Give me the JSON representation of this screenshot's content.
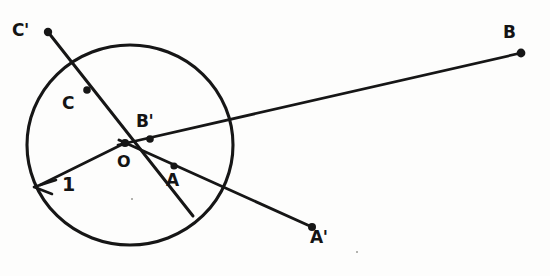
{
  "figure": {
    "background_color": "#fdfdfc",
    "ink_color": "#161616",
    "circle": {
      "name": "unit-circle",
      "center_x": 130,
      "center_y": 145,
      "radius_x": 103,
      "radius_y": 100
    },
    "radius_arrow": {
      "label": "1",
      "from_x": 125,
      "from_y": 143,
      "to_x": 35,
      "to_y": 187
    },
    "points": [
      {
        "id": "O",
        "label": "O",
        "x": 125,
        "y": 143,
        "label_x": 117,
        "label_y": 154,
        "dot": true
      },
      {
        "id": "A",
        "label": "A",
        "x": 174,
        "y": 166,
        "label_x": 166,
        "label_y": 172,
        "dot": true
      },
      {
        "id": "Ap",
        "label": "A'",
        "x": 312,
        "y": 227,
        "label_x": 311,
        "label_y": 229,
        "dot": true
      },
      {
        "id": "B",
        "label": "B",
        "x": 521,
        "y": 53,
        "label_x": 502,
        "label_y": 24,
        "dot": true
      },
      {
        "id": "Bp",
        "label": "B'",
        "x": 150,
        "y": 139,
        "label_x": 136,
        "label_y": 113,
        "dot": true
      },
      {
        "id": "C",
        "label": "C",
        "x": 87,
        "y": 90,
        "label_x": 62,
        "label_y": 95,
        "dot": true
      },
      {
        "id": "Cp",
        "label": "C'",
        "x": 48,
        "y": 32,
        "label_x": 12,
        "label_y": 22,
        "dot": true
      }
    ],
    "lines": [
      {
        "id": "ray-C-Cprime",
        "name": "line-O-C-Cprime",
        "x1": 48,
        "y1": 32,
        "x2": 192,
        "y2": 214
      },
      {
        "id": "ray-A-Aprime",
        "name": "line-O-A-Aprime",
        "x1": 125,
        "y1": 143,
        "x2": 312,
        "y2": 227
      },
      {
        "id": "ray-B-Bprime",
        "name": "line-O-Bprime-B",
        "x1": 125,
        "y1": 143,
        "x2": 521,
        "y2": 53
      }
    ],
    "label_texts": {
      "o": "O",
      "a": "A",
      "a_prime": "A'",
      "b": "B",
      "b_prime": "B'",
      "c": "C",
      "c_prime": "C'",
      "radius": "1"
    }
  }
}
